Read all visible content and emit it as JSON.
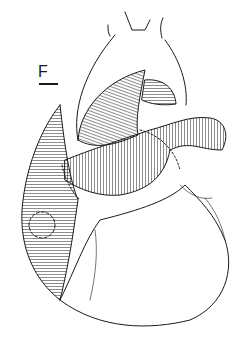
{
  "figure": {
    "panel_label": "F",
    "colors": {
      "ink": "#1a1a1a",
      "background": "#ffffff"
    }
  }
}
